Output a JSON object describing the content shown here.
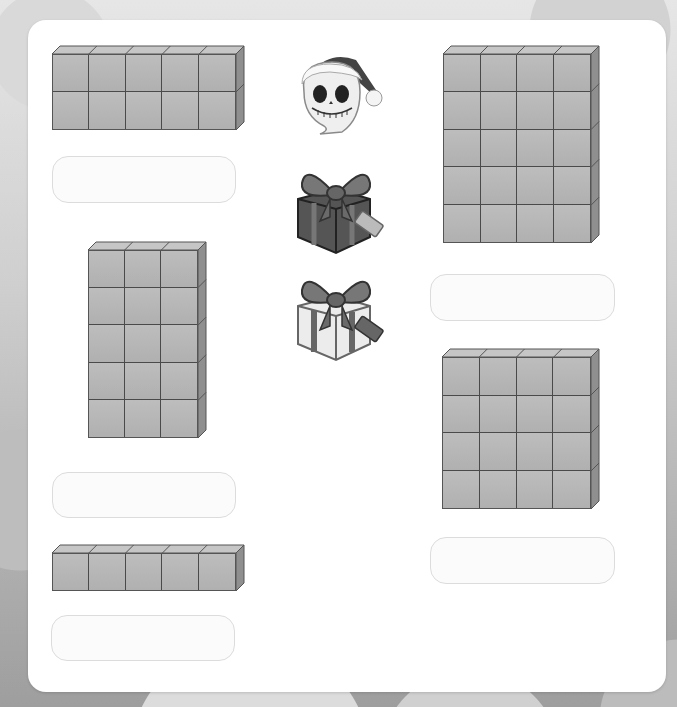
{
  "worksheet": {
    "card_color": "#ffffff",
    "cube_color": "#b3b3b3",
    "cube_edge_color": "#4a4a4a",
    "arrays": [
      {
        "id": "array-1",
        "columns": 5,
        "rows": 2
      },
      {
        "id": "array-2",
        "columns": 3,
        "rows": 5
      },
      {
        "id": "array-3",
        "columns": 5,
        "rows": 1
      },
      {
        "id": "array-4",
        "columns": 4,
        "rows": 5
      },
      {
        "id": "array-5",
        "columns": 4,
        "rows": 4
      }
    ],
    "answer_boxes": [
      {
        "id": "answer-1",
        "value": "",
        "placeholder": ""
      },
      {
        "id": "answer-2",
        "value": "",
        "placeholder": ""
      },
      {
        "id": "answer-3",
        "value": "",
        "placeholder": ""
      },
      {
        "id": "answer-4",
        "value": "",
        "placeholder": ""
      },
      {
        "id": "answer-5",
        "value": "",
        "placeholder": ""
      }
    ],
    "icons": [
      {
        "name": "skeleton-santa-hat-icon"
      },
      {
        "name": "dark-gift-box-icon"
      },
      {
        "name": "light-gift-box-icon"
      }
    ]
  }
}
